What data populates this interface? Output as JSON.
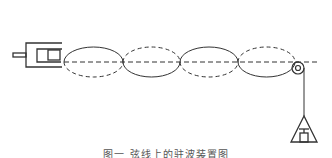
{
  "diagram": {
    "type": "standing-wave-on-string-apparatus",
    "stroke_color": "#333333",
    "components": {
      "vibrator": {
        "label": "vibrator-source",
        "position": "left"
      },
      "string": {
        "loops": 4,
        "center_line": "dashed"
      },
      "pulley": {
        "position": "right-end"
      },
      "weight": {
        "shape": "triangle-with-hanger",
        "position": "below-pulley"
      }
    }
  },
  "caption": {
    "text": "图一  弦线上的驻波装置图"
  }
}
